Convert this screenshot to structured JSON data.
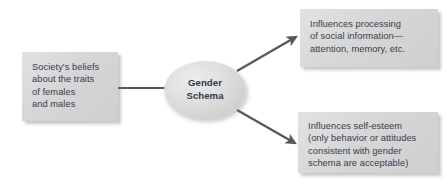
{
  "diagram": {
    "title": "Gender Schema",
    "background_color": "#ffffff",
    "node_fill_color": "#d6d6d6",
    "text_color": "#35404e",
    "connector_color": "#55595e",
    "nodes": {
      "source": {
        "label": "Society's beliefs\nabout the traits\nof females\nand males",
        "shape": "rectangle"
      },
      "schema": {
        "label": "Gender\nSchema",
        "shape": "ellipse"
      },
      "outcome_top": {
        "label": "Influences processing\nof social information—\nattention, memory, etc.",
        "shape": "rectangle"
      },
      "outcome_bottom": {
        "label": "Influences self-esteem\n(only behavior or attitudes\nconsistent with gender\nschema are acceptable)",
        "shape": "rectangle"
      }
    },
    "connectors": [
      {
        "name": "source-to-schema",
        "from": "source",
        "to": "schema",
        "style": "plain-line"
      },
      {
        "name": "schema-to-outcome-top",
        "from": "schema",
        "to": "outcome_top",
        "style": "arrow"
      },
      {
        "name": "schema-to-outcome-bottom",
        "from": "schema",
        "to": "outcome_bottom",
        "style": "arrow"
      }
    ]
  }
}
